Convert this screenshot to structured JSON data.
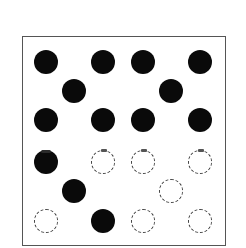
{
  "diagram": {
    "type": "dot-grid",
    "frame_color": "#555555",
    "filled_color": "#0a0a0a",
    "empty_border_color": "#444444",
    "rows": [
      {
        "dots": [
          {
            "x": 46,
            "y": 62,
            "state": "filled"
          },
          {
            "x": 103,
            "y": 62,
            "state": "filled"
          },
          {
            "x": 143,
            "y": 62,
            "state": "filled"
          },
          {
            "x": 200,
            "y": 62,
            "state": "filled"
          }
        ]
      },
      {
        "dots": [
          {
            "x": 74,
            "y": 91,
            "state": "filled"
          },
          {
            "x": 171,
            "y": 91,
            "state": "filled"
          }
        ]
      },
      {
        "dots": [
          {
            "x": 46,
            "y": 120,
            "state": "filled"
          },
          {
            "x": 103,
            "y": 120,
            "state": "filled"
          },
          {
            "x": 143,
            "y": 120,
            "state": "filled"
          },
          {
            "x": 200,
            "y": 120,
            "state": "filled"
          }
        ]
      },
      {
        "dots": [
          {
            "x": 46,
            "y": 162,
            "state": "filled",
            "notch": true
          },
          {
            "x": 103,
            "y": 162,
            "state": "empty",
            "mark": true
          },
          {
            "x": 143,
            "y": 162,
            "state": "empty",
            "mark": true
          },
          {
            "x": 200,
            "y": 162,
            "state": "empty",
            "mark": true
          }
        ]
      },
      {
        "dots": [
          {
            "x": 74,
            "y": 191,
            "state": "filled"
          },
          {
            "x": 171,
            "y": 191,
            "state": "empty"
          }
        ]
      },
      {
        "dots": [
          {
            "x": 46,
            "y": 221,
            "state": "empty"
          },
          {
            "x": 103,
            "y": 221,
            "state": "filled"
          },
          {
            "x": 143,
            "y": 221,
            "state": "empty"
          },
          {
            "x": 200,
            "y": 221,
            "state": "empty"
          }
        ]
      }
    ],
    "counts": {
      "filled": 15,
      "empty": 7,
      "total": 22
    }
  }
}
